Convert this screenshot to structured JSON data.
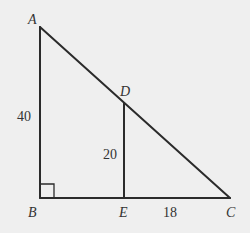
{
  "diagram": {
    "type": "geometry",
    "vertices": {
      "A": {
        "label": "A"
      },
      "B": {
        "label": "B"
      },
      "C": {
        "label": "C"
      },
      "D": {
        "label": "D"
      },
      "E": {
        "label": "E"
      }
    },
    "segments": [
      {
        "name": "AB",
        "length_label": "40"
      },
      {
        "name": "DE",
        "length_label": "20"
      },
      {
        "name": "EC",
        "length_label": "18"
      },
      {
        "name": "BC",
        "length_label": ""
      },
      {
        "name": "AC",
        "length_label": ""
      }
    ],
    "right_angle_at": "B",
    "colors": {
      "background": "#efefef",
      "line": "#2b2b2b",
      "text": "#333333"
    }
  }
}
